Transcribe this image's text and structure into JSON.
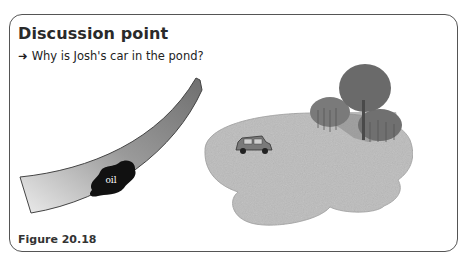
{
  "panel": {
    "title": "Discussion point",
    "question_arrow": "➜",
    "question": "Why is Josh's car in the pond?",
    "caption": "Figure 20.18"
  },
  "diagram": {
    "road": {
      "label": "curved road bend",
      "color_dark": "#6f6f6f",
      "color_light": "#e4e4e4"
    },
    "oil_patch": {
      "label": "oil",
      "color": "#111111",
      "text_color": "#ffffff"
    },
    "pond": {
      "label": "pond",
      "color": "#bcbcbc"
    },
    "car": {
      "label": "car in pond",
      "color": "#7a7a7a"
    },
    "trees": {
      "label": "trees by pond",
      "color": "#6a6a6a"
    }
  }
}
